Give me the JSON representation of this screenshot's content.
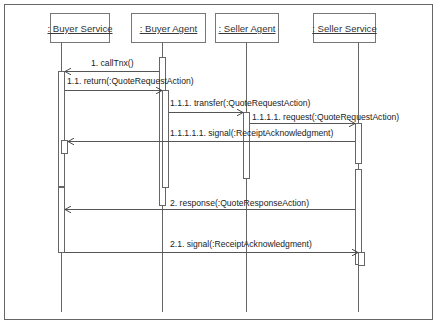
{
  "diagram": {
    "type": "uml-sequence",
    "colors": {
      "line": "#555555",
      "frame": "#666666",
      "text": "#222222",
      "box_fill": "#ffffff"
    },
    "lifelines": [
      {
        "id": "buyer_service",
        "label": ": Buyer Service"
      },
      {
        "id": "buyer_agent",
        "label": ": Buyer Agent"
      },
      {
        "id": "seller_agent",
        "label": ": Seller Agent"
      },
      {
        "id": "seller_service",
        "label": ": Seller Service"
      }
    ],
    "messages": [
      {
        "seq": "1",
        "label": "1. callTnx()",
        "from": "buyer_agent",
        "to": "buyer_service"
      },
      {
        "seq": "1.1",
        "label": "1.1. return(:QuoteRequestAction)",
        "from": "buyer_service",
        "to": "buyer_agent"
      },
      {
        "seq": "1.1.1",
        "label": "1.1.1. transfer(:QuoteRequestAction)",
        "from": "buyer_agent",
        "to": "seller_agent"
      },
      {
        "seq": "1.1.1.1",
        "label": "1.1.1.1. request(:QuoteRequestAction)",
        "from": "seller_agent",
        "to": "seller_service"
      },
      {
        "seq": "1.1.1.1.1",
        "label": "1.1.1.1.1. signal(:ReceiptAcknowledgment)",
        "from": "seller_service",
        "to": "buyer_service"
      },
      {
        "seq": "2",
        "label": "2. response(:QuoteResponseAction)",
        "from": "seller_service",
        "to": "buyer_service"
      },
      {
        "seq": "2.1",
        "label": "2.1. signal(:ReceiptAcknowledgment)",
        "from": "buyer_service",
        "to": "seller_service"
      }
    ]
  }
}
